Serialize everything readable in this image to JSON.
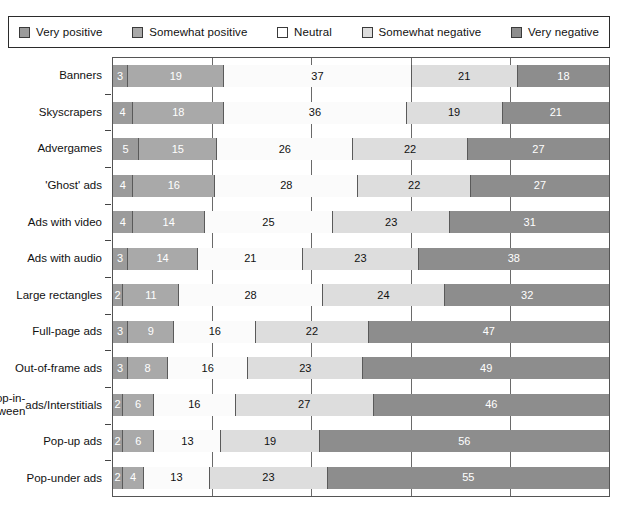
{
  "legend": {
    "items": [
      {
        "label": "Very positive",
        "color": "#9b9b9b",
        "icon": "square-swatch-icon"
      },
      {
        "label": "Somewhat positive",
        "color": "#a9a9a9",
        "icon": "square-swatch-icon"
      },
      {
        "label": "Neutral",
        "color": "#ffffff",
        "icon": "square-swatch-icon"
      },
      {
        "label": "Somewhat negative",
        "color": "#dddddd",
        "icon": "square-swatch-icon"
      },
      {
        "label": "Very negative",
        "color": "#8d8d8d",
        "icon": "square-swatch-icon"
      }
    ]
  },
  "chart_data": {
    "type": "bar",
    "orientation": "horizontal",
    "stacked": true,
    "stack_mode": "percent",
    "title": "",
    "subtitle": "",
    "xlabel": "",
    "ylabel": "",
    "xlim": [
      0,
      100
    ],
    "xticks": [
      0,
      20,
      40,
      60,
      80,
      100
    ],
    "grid": true,
    "legend_position": "top",
    "categories": [
      "Banners",
      "Skyscrapers",
      "Advergames",
      "'Ghost' ads",
      "Ads with video",
      "Ads with audio",
      "Large rectangles",
      "Full-page ads",
      "Out-of-frame ads",
      "Pop-in-between ads/Interstitials",
      "Pop-up ads",
      "Pop-under ads"
    ],
    "series": [
      {
        "name": "Very positive",
        "color": "#9b9b9b",
        "values": [
          3,
          4,
          5,
          4,
          4,
          3,
          2,
          3,
          3,
          2,
          2,
          2
        ]
      },
      {
        "name": "Somewhat positive",
        "color": "#a9a9a9",
        "values": [
          19,
          18,
          15,
          16,
          14,
          14,
          11,
          9,
          8,
          6,
          6,
          4
        ]
      },
      {
        "name": "Neutral",
        "color": "#fbfbfb",
        "values": [
          37,
          36,
          26,
          28,
          25,
          21,
          28,
          16,
          16,
          16,
          13,
          13
        ]
      },
      {
        "name": "Somewhat negative",
        "color": "#dddddd",
        "values": [
          21,
          19,
          22,
          22,
          23,
          23,
          24,
          22,
          23,
          27,
          19,
          23
        ]
      },
      {
        "name": "Very negative",
        "color": "#8d8d8d",
        "values": [
          18,
          21,
          27,
          27,
          31,
          38,
          32,
          47,
          49,
          46,
          56,
          55
        ]
      }
    ],
    "rows": [
      {
        "label": "Banners",
        "label_lines": [
          "Banners"
        ],
        "values": [
          3,
          19,
          37,
          21,
          18
        ]
      },
      {
        "label": "Skyscrapers",
        "label_lines": [
          "Skyscrapers"
        ],
        "values": [
          4,
          18,
          36,
          19,
          21
        ]
      },
      {
        "label": "Advergames",
        "label_lines": [
          "Advergames"
        ],
        "values": [
          5,
          15,
          26,
          22,
          27
        ]
      },
      {
        "label": "'Ghost' ads",
        "label_lines": [
          "'Ghost' ads"
        ],
        "values": [
          4,
          16,
          28,
          22,
          27
        ]
      },
      {
        "label": "Ads with video",
        "label_lines": [
          "Ads with video"
        ],
        "values": [
          4,
          14,
          25,
          23,
          31
        ]
      },
      {
        "label": "Ads with audio",
        "label_lines": [
          "Ads with audio"
        ],
        "values": [
          3,
          14,
          21,
          23,
          38
        ]
      },
      {
        "label": "Large rectangles",
        "label_lines": [
          "Large rectangles"
        ],
        "values": [
          2,
          11,
          28,
          24,
          32
        ]
      },
      {
        "label": "Full-page ads",
        "label_lines": [
          "Full-page ads"
        ],
        "values": [
          3,
          9,
          16,
          22,
          47
        ]
      },
      {
        "label": "Out-of-frame ads",
        "label_lines": [
          "Out-of-frame ads"
        ],
        "values": [
          3,
          8,
          16,
          23,
          49
        ]
      },
      {
        "label": "Pop-in-between ads/Interstitials",
        "label_lines": [
          "Pop-in-between",
          "ads/Interstitials"
        ],
        "values": [
          2,
          6,
          16,
          27,
          46
        ]
      },
      {
        "label": "Pop-up ads",
        "label_lines": [
          "Pop-up ads"
        ],
        "values": [
          2,
          6,
          13,
          19,
          56
        ]
      },
      {
        "label": "Pop-under ads",
        "label_lines": [
          "Pop-under ads"
        ],
        "values": [
          2,
          4,
          13,
          23,
          55
        ]
      }
    ]
  }
}
